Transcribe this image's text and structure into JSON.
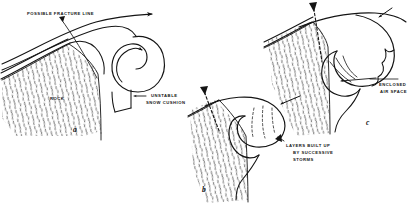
{
  "figure": {
    "type": "technical-line-diagram",
    "background_color": "#ffffff",
    "ink_color": "#141414",
    "panels": [
      {
        "id": "a",
        "label": "a",
        "label_x": 73,
        "label_y": 131,
        "description": "Wind blowing over ridge crest forming lee eddy and unstable snow cushion"
      },
      {
        "id": "b",
        "label": "b",
        "label_x": 202,
        "label_y": 191,
        "description": "Cornice growing outward with internal storm layers"
      },
      {
        "id": "c",
        "label": "c",
        "label_x": 366,
        "label_y": 124,
        "description": "Mature overhanging cornice with enclosed air space beneath"
      }
    ],
    "annotations": [
      {
        "id": "possible-fracture-line",
        "lines": [
          "POSSIBLE FRACTURE LINE"
        ],
        "x": 27,
        "y": 12,
        "align": "left",
        "leader": "diagonal-line-to-ridge"
      },
      {
        "id": "rock",
        "lines": [
          "ROCK"
        ],
        "x": 50,
        "y": 97,
        "align": "left",
        "leader": "none"
      },
      {
        "id": "unstable-snow-cushion",
        "lines": [
          "UNSTABLE",
          "SNOW CUSHION"
        ],
        "x": 135,
        "y": 94,
        "align": "left",
        "leader": "left-arrow"
      },
      {
        "id": "layers-built-up-by-successive-storms",
        "lines": [
          "LAYERS BUILT UP",
          "BY SUCCESSIVE",
          "STORMS"
        ],
        "x": 279,
        "y": 144,
        "align": "left",
        "leader": "left-arrow-to-cornice"
      },
      {
        "id": "enclosed-air-space",
        "lines": [
          "ENCLOSED",
          "AIR SPACE"
        ],
        "x": 377,
        "y": 83,
        "align": "left",
        "leader": "horizontal-line-and-pointer"
      }
    ]
  }
}
